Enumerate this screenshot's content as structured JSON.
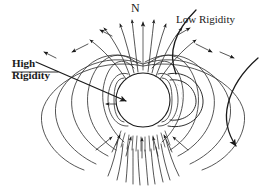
{
  "figure": {
    "background_color": "#ffffff",
    "line_color": "#1a1a1a",
    "width": 264,
    "height": 189
  },
  "labels": {
    "north_pole": "N",
    "low_rigidity": "Low Rigidity",
    "high_rigidity_line1": "High",
    "high_rigidity_line2": "Rigidity"
  },
  "elements": {
    "central_body_name": "planet-sphere",
    "field_line_count": 5,
    "radiation_belt_name": "radiation-belt-mesh",
    "axis_name": "magnetic-axis"
  }
}
